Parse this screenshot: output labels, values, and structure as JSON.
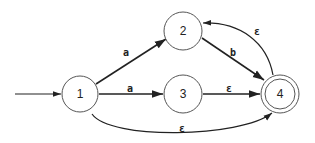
{
  "diagram": {
    "type": "nfa",
    "states": [
      {
        "id": "1",
        "label": "1",
        "start": true,
        "accepting": false
      },
      {
        "id": "2",
        "label": "2",
        "start": false,
        "accepting": false
      },
      {
        "id": "3",
        "label": "3",
        "start": false,
        "accepting": false
      },
      {
        "id": "4",
        "label": "4",
        "start": false,
        "accepting": true
      }
    ],
    "transitions": [
      {
        "from": "1",
        "to": "2",
        "label": "a"
      },
      {
        "from": "1",
        "to": "3",
        "label": "a"
      },
      {
        "from": "2",
        "to": "4",
        "label": "b"
      },
      {
        "from": "3",
        "to": "4",
        "label": "ε"
      },
      {
        "from": "4",
        "to": "2",
        "label": "ε"
      },
      {
        "from": "1",
        "to": "4",
        "label": "ε"
      }
    ]
  }
}
